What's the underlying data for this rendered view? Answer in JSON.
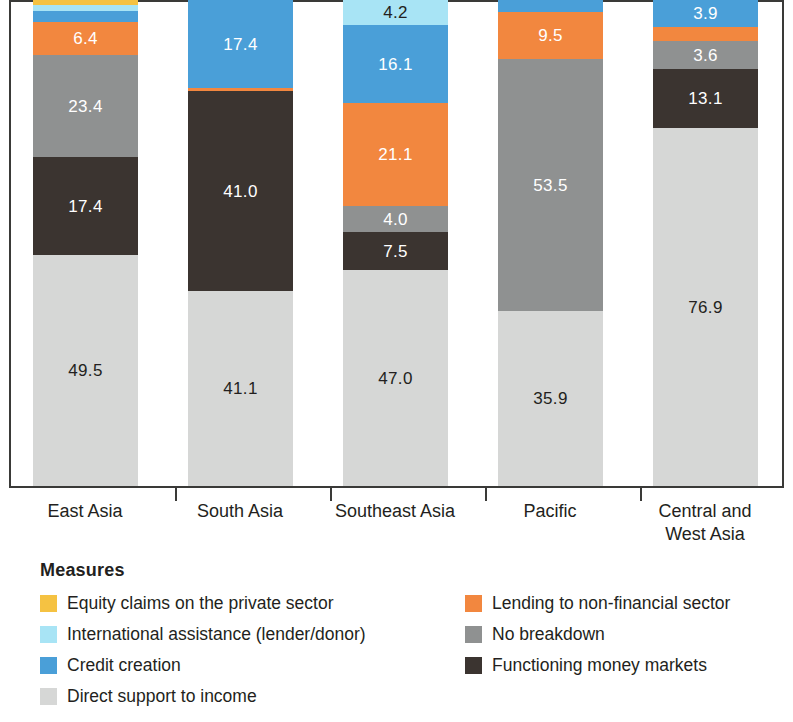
{
  "chart_data": {
    "type": "bar",
    "title": "",
    "subtitle": "",
    "xlabel": "",
    "ylabel": "",
    "stacked": true,
    "orientation": "vertical",
    "grid": false,
    "legend_position": "bottom",
    "legend_title": "Measures",
    "ylim": [
      0,
      100
    ],
    "note": "Top of bars is cropped by the image frame; stacks sum to ~100%.",
    "categories": [
      "East Asia",
      "South Asia",
      "Southeast Asia",
      "Pacific",
      "Central and West Asia"
    ],
    "category_labels_multiline": [
      [
        "East Asia"
      ],
      [
        "South Asia"
      ],
      [
        "Southeast Asia"
      ],
      [
        "Pacific"
      ],
      [
        "Central and",
        "West Asia"
      ]
    ],
    "series": [
      {
        "name": "Equity claims on the private sector",
        "color": "#f5c242",
        "values": [
          1.1,
          0.0,
          0.0,
          0.0,
          0.0
        ],
        "labels": [
          "",
          "",
          "",
          "",
          ""
        ]
      },
      {
        "name": "International assistance (lender/donor)",
        "color": "#a8e4f5",
        "values": [
          1.3,
          0.0,
          4.2,
          0.0,
          0.0
        ],
        "labels": [
          "",
          "",
          "4.2",
          "",
          ""
        ]
      },
      {
        "name": "Credit creation",
        "color": "#4a9fd8",
        "values": [
          2.3,
          17.4,
          16.1,
          2.1,
          3.9
        ],
        "labels": [
          "",
          "17.4",
          "16.1",
          "",
          "3.9"
        ]
      },
      {
        "name": "Lending to non-financial sector",
        "color": "#f2873f",
        "values": [
          6.4,
          0.5,
          21.1,
          9.5,
          2.5
        ],
        "labels": [
          "6.4",
          "",
          "21.1",
          "9.5",
          ""
        ]
      },
      {
        "name": "No breakdown",
        "color": "#8f9191",
        "values": [
          23.4,
          0.0,
          4.0,
          53.5,
          3.6
        ],
        "labels": [
          "23.4",
          "",
          "4.0",
          "53.5",
          "3.6"
        ]
      },
      {
        "name": "Functioning money markets",
        "color": "#3b3430",
        "values": [
          17.4,
          41.0,
          7.5,
          0.0,
          13.1
        ],
        "labels": [
          "17.4",
          "41.0",
          "7.5",
          "",
          "13.1"
        ]
      },
      {
        "name": "Direct support to income",
        "color": "#d6d7d6",
        "values": [
          49.5,
          41.1,
          47.0,
          35.9,
          76.9
        ],
        "labels": [
          "49.5",
          "41.1",
          "47.0",
          "35.9",
          "76.9"
        ]
      }
    ]
  },
  "legend": {
    "title": "Measures",
    "left_column": [
      {
        "label": "Equity claims on the private sector",
        "color": "#f5c242",
        "icon": "legend-swatch-equity"
      },
      {
        "label": "International assistance (lender/donor)",
        "color": "#a8e4f5",
        "icon": "legend-swatch-international-assistance"
      },
      {
        "label": "Credit creation",
        "color": "#4a9fd8",
        "icon": "legend-swatch-credit-creation"
      },
      {
        "label": "Direct support to income",
        "color": "#d6d7d6",
        "icon": "legend-swatch-direct-support"
      }
    ],
    "right_column": [
      {
        "label": "Lending to non-financial sector",
        "color": "#f2873f",
        "icon": "legend-swatch-lending"
      },
      {
        "label": "No breakdown",
        "color": "#8f9191",
        "icon": "legend-swatch-no-breakdown"
      },
      {
        "label": "Functioning money markets",
        "color": "#3b3430",
        "icon": "legend-swatch-money-markets"
      }
    ]
  },
  "axis": {
    "category_ticks": 4,
    "line_color": "#3a3a38"
  },
  "bars": [
    {
      "category": "East Asia",
      "label_line1": "East Asia",
      "label_line2": "",
      "segments": [
        {
          "series": "Equity claims on the private sector",
          "value": 1.1,
          "label": "",
          "px": 5,
          "color": "#f5c242",
          "text": "light"
        },
        {
          "series": "International assistance (lender/donor)",
          "value": 1.3,
          "label": "",
          "px": 6,
          "color": "#a8e4f5",
          "text": "dark"
        },
        {
          "series": "Credit creation",
          "value": 2.3,
          "label": "",
          "px": 11,
          "color": "#4a9fd8",
          "text": "light"
        },
        {
          "series": "Lending to non-financial sector",
          "value": 6.4,
          "label": "6.4",
          "px": 33,
          "color": "#f2873f",
          "text": "light"
        },
        {
          "series": "No breakdown",
          "value": 23.4,
          "label": "23.4",
          "px": 102,
          "color": "#8f9191",
          "text": "light"
        },
        {
          "series": "Functioning money markets",
          "value": 17.4,
          "label": "17.4",
          "px": 98,
          "color": "#3b3430",
          "text": "light"
        },
        {
          "series": "Direct support to income",
          "value": 49.5,
          "label": "49.5",
          "px": 231,
          "color": "#d6d7d6",
          "text": "dark"
        }
      ]
    },
    {
      "category": "South Asia",
      "label_line1": "South Asia",
      "label_line2": "",
      "segments": [
        {
          "series": "Credit creation",
          "value": 17.4,
          "label": "17.4",
          "px": 88,
          "color": "#4a9fd8",
          "text": "light"
        },
        {
          "series": "Lending to non-financial sector",
          "value": 0.5,
          "label": "",
          "px": 3,
          "color": "#f2873f",
          "text": "light"
        },
        {
          "series": "Functioning money markets",
          "value": 41.0,
          "label": "41.0",
          "px": 200,
          "color": "#3b3430",
          "text": "light"
        },
        {
          "series": "Direct support to income",
          "value": 41.1,
          "label": "41.1",
          "px": 195,
          "color": "#d6d7d6",
          "text": "dark"
        }
      ]
    },
    {
      "category": "Southeast Asia",
      "label_line1": "Southeast Asia",
      "label_line2": "",
      "segments": [
        {
          "series": "International assistance (lender/donor)",
          "value": 4.2,
          "label": "4.2",
          "px": 25,
          "color": "#a8e4f5",
          "text": "dark"
        },
        {
          "series": "Credit creation",
          "value": 16.1,
          "label": "16.1",
          "px": 78,
          "color": "#4a9fd8",
          "text": "light"
        },
        {
          "series": "Lending to non-financial sector",
          "value": 21.1,
          "label": "21.1",
          "px": 103,
          "color": "#f2873f",
          "text": "light"
        },
        {
          "series": "No breakdown",
          "value": 4.0,
          "label": "4.0",
          "px": 26,
          "color": "#8f9191",
          "text": "light"
        },
        {
          "series": "Functioning money markets",
          "value": 7.5,
          "label": "7.5",
          "px": 38,
          "color": "#3b3430",
          "text": "light"
        },
        {
          "series": "Direct support to income",
          "value": 47.0,
          "label": "47.0",
          "px": 216,
          "color": "#d6d7d6",
          "text": "dark"
        }
      ]
    },
    {
      "category": "Pacific",
      "label_line1": "Pacific",
      "label_line2": "",
      "segments": [
        {
          "series": "Credit creation",
          "value": 2.1,
          "label": "",
          "px": 12,
          "color": "#4a9fd8",
          "text": "light"
        },
        {
          "series": "Lending to non-financial sector",
          "value": 9.5,
          "label": "9.5",
          "px": 47,
          "color": "#f2873f",
          "text": "light"
        },
        {
          "series": "No breakdown",
          "value": 53.5,
          "label": "53.5",
          "px": 252,
          "color": "#8f9191",
          "text": "light"
        },
        {
          "series": "Direct support to income",
          "value": 35.9,
          "label": "35.9",
          "px": 175,
          "color": "#d6d7d6",
          "text": "dark"
        }
      ]
    },
    {
      "category": "Central and West Asia",
      "label_line1": "Central and",
      "label_line2": "West Asia",
      "segments": [
        {
          "series": "Credit creation",
          "value": 3.9,
          "label": "3.9",
          "px": 27,
          "color": "#4a9fd8",
          "text": "light"
        },
        {
          "series": "Lending to non-financial sector",
          "value": 2.5,
          "label": "",
          "px": 14,
          "color": "#f2873f",
          "text": "light"
        },
        {
          "series": "No breakdown",
          "value": 3.6,
          "label": "3.6",
          "px": 28,
          "color": "#8f9191",
          "text": "light"
        },
        {
          "series": "Functioning money markets",
          "value": 13.1,
          "label": "13.1",
          "px": 59,
          "color": "#3b3430",
          "text": "light"
        },
        {
          "series": "Direct support to income",
          "value": 76.9,
          "label": "76.9",
          "px": 358,
          "color": "#d6d7d6",
          "text": "dark"
        }
      ]
    }
  ],
  "layout": {
    "bar_width_px": 105,
    "bar_left_px": [
      22,
      177,
      332,
      487,
      642
    ],
    "tick_left_px": [
      164,
      319,
      474,
      629
    ],
    "cat_label_left_px": [
      -1,
      154,
      309,
      464,
      619
    ]
  }
}
